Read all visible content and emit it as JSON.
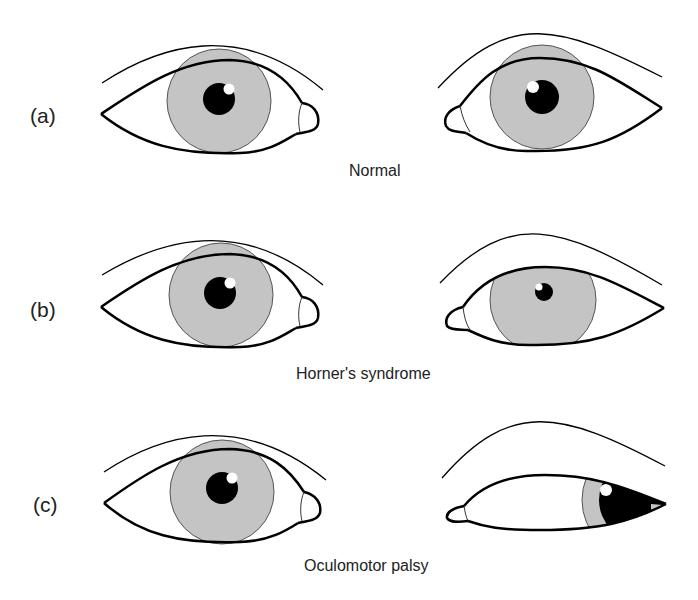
{
  "figure": {
    "rows": [
      {
        "letter": "(a)",
        "caption": "Normal",
        "left_eye": "normal",
        "right_eye": "normal"
      },
      {
        "letter": "(b)",
        "caption": "Horner's syndrome",
        "left_eye": "normal",
        "right_eye": "ptosis with miosis (small pupil)"
      },
      {
        "letter": "(c)",
        "caption": "Oculomotor palsy",
        "left_eye": "normal",
        "right_eye": "ptosis, eye deviated down and out, dilated pupil"
      }
    ]
  },
  "colors": {
    "iris": "#c4c4c4",
    "outline": "#000000",
    "background": "#ffffff"
  }
}
